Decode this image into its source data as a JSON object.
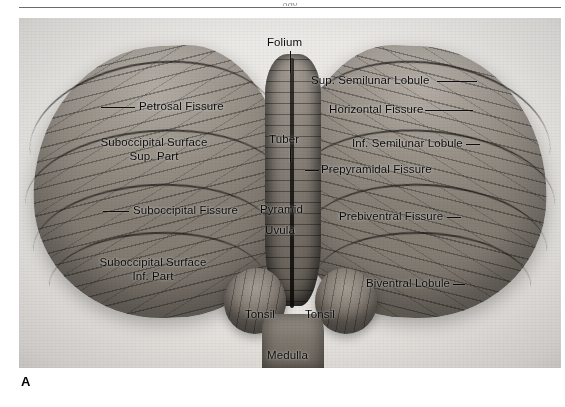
{
  "page": {
    "running_head_fragment": "ogy",
    "panel_letter": "A"
  },
  "figure": {
    "specimen": "cerebellum-inferior-view",
    "panel_letter": "A",
    "background_color": "#e9e7e3",
    "label_color": "#0c0c0c"
  },
  "labels": {
    "folium": "Folium",
    "petrosal_fissure": "Petrosal Fissure",
    "suboccipital_surface_sup_line1": "Suboccipital Surface",
    "suboccipital_surface_sup_line2": "Sup. Part",
    "suboccipital_fissure": "Suboccipital Fissure",
    "suboccipital_surface_inf_line1": "Suboccipital Surface",
    "suboccipital_surface_inf_line2": "Inf. Part",
    "tuber": "Tuber",
    "pyramid": "Pyramid",
    "uvula": "Uvula",
    "tonsil_left": "Tonsil",
    "tonsil_right": "Tonsil",
    "medulla": "Medulla",
    "sup_semilunar_lobule": "Sup. Semilunar Lobule",
    "horizontal_fissure": "Horizontal Fissure",
    "inf_semilunar_lobule": "Inf. Semilunar Lobule",
    "prepyramidal_fissure": "Prepyramidal Fissure",
    "prebiventral_fissure": "Prebiventral Fissure",
    "biventral_lobule": "Biventral Lobule"
  }
}
